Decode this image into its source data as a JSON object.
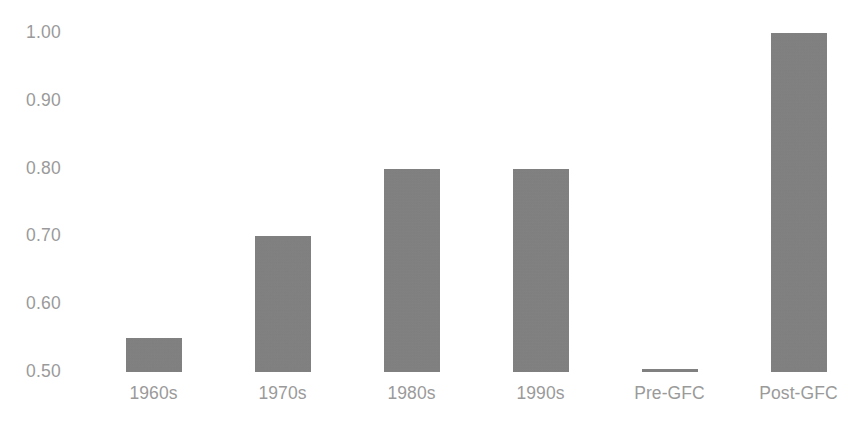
{
  "chart_data": {
    "type": "bar",
    "title": "",
    "subtitle": "",
    "xlabel": "",
    "ylabel": "",
    "categories": [
      "1960s",
      "1970s",
      "1980s",
      "1990s",
      "Pre-GFC",
      "Post-GFC"
    ],
    "values": [
      0.55,
      0.7,
      0.8,
      0.8,
      0.505,
      1.0
    ],
    "ylim": [
      0.5,
      1.0
    ],
    "yticks": [
      0.5,
      0.6,
      0.7,
      0.8,
      0.9,
      1.0
    ],
    "ytick_labels": [
      "0.50",
      "0.60",
      "0.70",
      "0.80",
      "0.90",
      "1.00"
    ],
    "grid": false,
    "legend": false,
    "legend_position": "none",
    "series": [
      {
        "name": "",
        "values": [
          0.55,
          0.7,
          0.8,
          0.8,
          0.505,
          1.0
        ]
      }
    ],
    "annotations": []
  },
  "style": {
    "background_color": "#ffffff",
    "bar_color": "#808080",
    "tick_label_color": "#9a9a9a",
    "category_label_color": "#9a9a9a"
  }
}
